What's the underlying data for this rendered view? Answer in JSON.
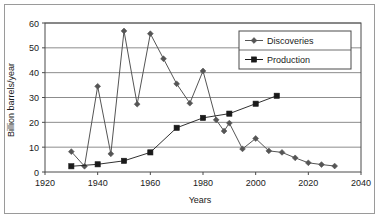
{
  "chart_data": {
    "type": "line",
    "title": "",
    "xlabel": "Years",
    "ylabel": "Billion barrels/year",
    "xlim": [
      1920,
      2040
    ],
    "ylim": [
      0,
      60
    ],
    "xticks": [
      1920,
      1940,
      1960,
      1980,
      2000,
      2020,
      2040
    ],
    "yticks": [
      0,
      10,
      20,
      30,
      40,
      50,
      60
    ],
    "xtick_labels": [
      "1920",
      "1940",
      "1960",
      "1980",
      "2000",
      "2020",
      "2040"
    ],
    "ytick_labels": [
      "0",
      "10",
      "20",
      "30",
      "40",
      "50",
      "60"
    ],
    "grid": "horizontal",
    "legend_position": "top-right",
    "series": [
      {
        "name": "Discoveries",
        "marker": "diamond",
        "color": "#555555",
        "points": [
          {
            "x": 1930,
            "y": 8.2
          },
          {
            "x": 1935,
            "y": 2.3
          },
          {
            "x": 1940,
            "y": 34.5
          },
          {
            "x": 1945,
            "y": 7.3
          },
          {
            "x": 1950,
            "y": 56.8
          },
          {
            "x": 1955,
            "y": 27.3
          },
          {
            "x": 1960,
            "y": 55.7
          },
          {
            "x": 1965,
            "y": 45.6
          },
          {
            "x": 1970,
            "y": 35.5
          },
          {
            "x": 1975,
            "y": 27.7
          },
          {
            "x": 1980,
            "y": 40.7
          },
          {
            "x": 1985,
            "y": 21.0
          },
          {
            "x": 1988,
            "y": 16.5
          },
          {
            "x": 1990,
            "y": 19.7
          },
          {
            "x": 1995,
            "y": 9.3
          },
          {
            "x": 2000,
            "y": 13.5
          },
          {
            "x": 2005,
            "y": 8.5
          },
          {
            "x": 2010,
            "y": 7.9
          },
          {
            "x": 2015,
            "y": 5.7
          },
          {
            "x": 2020,
            "y": 3.7
          },
          {
            "x": 2025,
            "y": 3.0
          },
          {
            "x": 2030,
            "y": 2.4
          }
        ]
      },
      {
        "name": "Production",
        "marker": "square",
        "color": "#1a1a1a",
        "points": [
          {
            "x": 1930,
            "y": 2.3
          },
          {
            "x": 1940,
            "y": 3.1
          },
          {
            "x": 1950,
            "y": 4.5
          },
          {
            "x": 1960,
            "y": 7.9
          },
          {
            "x": 1970,
            "y": 17.8
          },
          {
            "x": 1980,
            "y": 21.8
          },
          {
            "x": 1990,
            "y": 23.5
          },
          {
            "x": 2000,
            "y": 27.5
          },
          {
            "x": 2008,
            "y": 30.7
          }
        ]
      }
    ]
  },
  "legend": {
    "items": [
      {
        "label": "Discoveries"
      },
      {
        "label": "Production"
      }
    ]
  },
  "colors": {
    "discoveries": "#555555",
    "production": "#1a1a1a",
    "grid": "#8c8c8c",
    "axis": "#4a4a4a",
    "frame": "#9a9a9a",
    "background": "#ffffff",
    "text": "#1a1a1a"
  }
}
